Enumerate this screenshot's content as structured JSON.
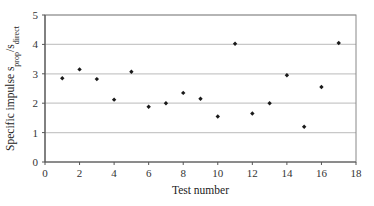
{
  "chart_data": {
    "type": "scatter",
    "title": "",
    "xlabel": "Test number",
    "ylabel": "Specific impulse s_prop/s_direct",
    "ylabel_parts": {
      "main": "Specific impulse s",
      "sub1": "prop",
      "slash": "/s",
      "sub2": "direct"
    },
    "xlim": [
      0,
      18
    ],
    "ylim": [
      0,
      5
    ],
    "xticks": [
      0,
      2,
      4,
      6,
      8,
      10,
      12,
      14,
      16,
      18
    ],
    "yticks": [
      0,
      1,
      2,
      3,
      4,
      5
    ],
    "grid": {
      "y": true,
      "x": false
    },
    "legend": null,
    "series": [
      {
        "name": "Specific impulse",
        "marker": "diamond",
        "color": "#1a1a1a",
        "x": [
          1,
          2,
          3,
          4,
          5,
          6,
          7,
          8,
          9,
          10,
          11,
          12,
          13,
          14,
          15,
          16,
          17
        ],
        "y": [
          2.85,
          3.15,
          2.82,
          2.12,
          3.07,
          1.88,
          2.0,
          2.35,
          2.15,
          1.55,
          4.02,
          1.65,
          2.0,
          2.95,
          1.2,
          2.55,
          4.05
        ]
      }
    ]
  },
  "colors": {
    "gridline": "#c8c8c8",
    "axis": "#555555",
    "frame": "#888888",
    "marker": "#1a1a1a"
  }
}
